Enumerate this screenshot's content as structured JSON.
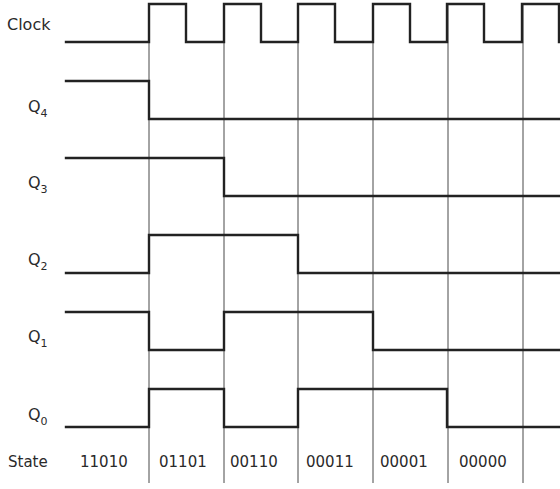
{
  "diagram": {
    "type": "timing-diagram",
    "signals": [
      {
        "name": "Clock",
        "base": "Clock",
        "subscript": "",
        "high_y": 4,
        "low_y": 42,
        "label_y": 30,
        "points": [
          [
            66,
            42
          ],
          [
            149,
            42
          ],
          [
            149,
            4
          ],
          [
            186,
            4
          ],
          [
            186,
            42
          ],
          [
            224,
            42
          ],
          [
            224,
            4
          ],
          [
            261,
            4
          ],
          [
            261,
            42
          ],
          [
            298,
            42
          ],
          [
            298,
            4
          ],
          [
            335,
            4
          ],
          [
            335,
            42
          ],
          [
            373,
            42
          ],
          [
            373,
            4
          ],
          [
            410,
            4
          ],
          [
            410,
            42
          ],
          [
            447,
            42
          ],
          [
            447,
            4
          ],
          [
            484,
            4
          ],
          [
            484,
            42
          ],
          [
            522,
            42
          ],
          [
            522,
            4
          ],
          [
            559,
            4
          ],
          [
            559,
            42
          ]
        ]
      },
      {
        "name": "Q4",
        "base": "Q",
        "subscript": "4",
        "label_y": 112,
        "points": [
          [
            66,
            81
          ],
          [
            149,
            81
          ],
          [
            149,
            119
          ],
          [
            560,
            119
          ]
        ]
      },
      {
        "name": "Q3",
        "base": "Q",
        "subscript": "3",
        "label_y": 188,
        "points": [
          [
            66,
            158
          ],
          [
            224,
            158
          ],
          [
            224,
            196
          ],
          [
            560,
            196
          ]
        ]
      },
      {
        "name": "Q2",
        "base": "Q",
        "subscript": "2",
        "label_y": 265,
        "points": [
          [
            66,
            273
          ],
          [
            149,
            273
          ],
          [
            149,
            235
          ],
          [
            298,
            235
          ],
          [
            298,
            273
          ],
          [
            560,
            273
          ]
        ]
      },
      {
        "name": "Q1",
        "base": "Q",
        "subscript": "1",
        "label_y": 342,
        "points": [
          [
            66,
            312
          ],
          [
            149,
            312
          ],
          [
            149,
            350
          ],
          [
            224,
            350
          ],
          [
            224,
            312
          ],
          [
            373,
            312
          ],
          [
            373,
            350
          ],
          [
            560,
            350
          ]
        ]
      },
      {
        "name": "Q0",
        "base": "Q",
        "subscript": "0",
        "label_y": 420,
        "points": [
          [
            66,
            427
          ],
          [
            149,
            427
          ],
          [
            149,
            389
          ],
          [
            224,
            389
          ],
          [
            224,
            427
          ],
          [
            298,
            427
          ],
          [
            298,
            389
          ],
          [
            447,
            389
          ],
          [
            447,
            427
          ],
          [
            560,
            427
          ]
        ]
      }
    ],
    "grid_lines_x": [
      149,
      224,
      298,
      373,
      448,
      523
    ],
    "grid_top": 4,
    "grid_bottom": 483,
    "state_row": {
      "label": "State",
      "label_y": 467,
      "values": [
        {
          "text": "11010",
          "x": 80
        },
        {
          "text": "01101",
          "x": 159
        },
        {
          "text": "00110",
          "x": 230
        },
        {
          "text": "00011",
          "x": 306
        },
        {
          "text": "00001",
          "x": 380
        },
        {
          "text": "00000",
          "x": 459
        }
      ]
    },
    "colors": {
      "line": "#222222",
      "grid": "#333333",
      "text": "#2a2a2a",
      "background": "#ffffff"
    }
  }
}
